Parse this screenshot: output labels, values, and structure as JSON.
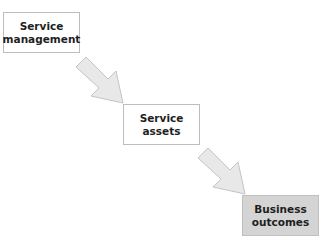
{
  "diagram": {
    "nodes": [
      {
        "id": "service-management",
        "label": "Service\nmanagement",
        "fill": "#ffffff"
      },
      {
        "id": "service-assets",
        "label": "Service\nassets",
        "fill": "#ffffff"
      },
      {
        "id": "business-outcomes",
        "label": "Business\noutcomes",
        "fill": "#d4d4d4"
      }
    ],
    "edges": [
      {
        "from": "service-management",
        "to": "service-assets"
      },
      {
        "from": "service-assets",
        "to": "business-outcomes"
      }
    ],
    "arrow_color": "#e6e6e6",
    "arrow_border": "#c8c8c8"
  }
}
